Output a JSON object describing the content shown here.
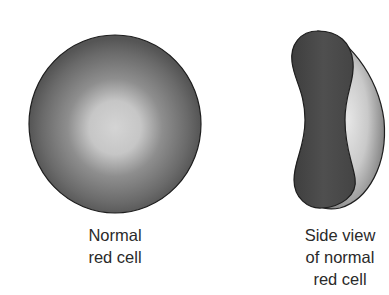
{
  "figures": [
    {
      "id": "front",
      "caption_lines": [
        "Normal",
        "red cell"
      ]
    },
    {
      "id": "side",
      "caption_lines": [
        "Side view",
        "of normal",
        "red cell"
      ]
    }
  ],
  "colors": {
    "cell_rim": "#5a5a5a",
    "cell_center": "#cfcfcf",
    "side_dark": "#4a4a4a",
    "side_light": "#d8d8d8",
    "outline": "#1e1e1e"
  }
}
